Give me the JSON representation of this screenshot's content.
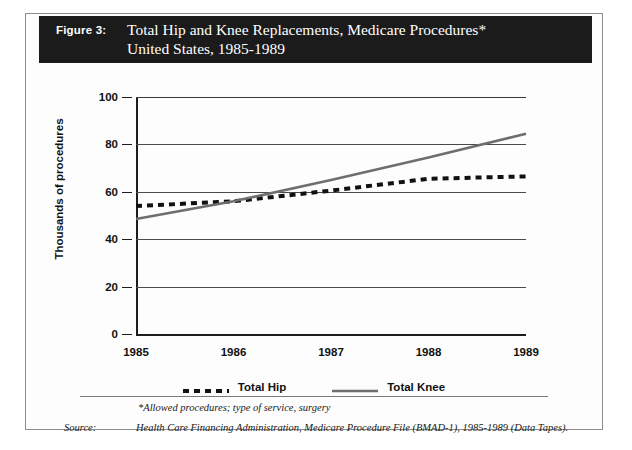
{
  "figure": {
    "label": "Figure 3:",
    "title_line1": "Total Hip and Knee Replacements, Medicare Procedures*",
    "title_line2": "United States, 1985-1989"
  },
  "footnote": "*Allowed procedures; type of service, surgery",
  "source": {
    "label": "Source:",
    "text": "Health Care Financing Administration, Medicare Procedure File (BMAD-1), 1985-1989 (Data Tapes)."
  },
  "legend": {
    "items": [
      {
        "label": "Total Hip",
        "style": "dashed",
        "color": "#111111"
      },
      {
        "label": "Total Knee",
        "style": "solid",
        "color": "#6e6e6e"
      }
    ]
  },
  "colors": {
    "title_bar_bg": "#1b1b1b",
    "title_bar_fg": "#ffffff",
    "hip_line": "#111111",
    "knee_line": "#6e6e6e",
    "gridline": "#4a4a4a",
    "axis": "#1d1d1d"
  },
  "chart_data": {
    "type": "line",
    "xlabel": "",
    "ylabel": "Thousands of procedures",
    "categories": [
      "1985",
      "1986",
      "1987",
      "1988",
      "1989"
    ],
    "x": [
      1985,
      1986,
      1987,
      1988,
      1989
    ],
    "ylim": [
      0,
      100
    ],
    "yticks": [
      0,
      20,
      40,
      60,
      80,
      100
    ],
    "ytick_labels": [
      "0",
      "20",
      "40",
      "60",
      "80",
      "100"
    ],
    "grid": true,
    "legend_position": "bottom",
    "series": [
      {
        "name": "Total Hip",
        "style": "dashed",
        "color": "#111111",
        "values": [
          54,
          56,
          60.5,
          65.5,
          66.5
        ]
      },
      {
        "name": "Total Knee",
        "style": "solid",
        "color": "#6e6e6e",
        "values": [
          48.5,
          56,
          65,
          74.5,
          84.5
        ]
      }
    ]
  }
}
